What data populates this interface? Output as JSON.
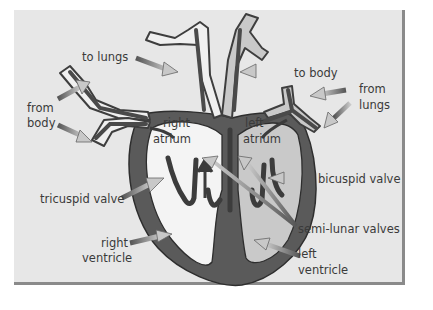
{
  "diagram": {
    "colors": {
      "background": "#e7e7e7",
      "panel_border": "#8a8a8a",
      "heart_wall": "#5a5a5a",
      "outline": "#2e2e2e",
      "right_side_chamber": "#f4f4f4",
      "left_side_chamber": "#c9c9c9",
      "label_arrow_dark": "#5c5c5c",
      "label_arrow_light": "#bdbdbd",
      "text": "#3a3a3a"
    },
    "labels": {
      "to_lungs": "to lungs",
      "from_body_1": "from",
      "from_body_2": "body",
      "right_atrium_1": "right",
      "right_atrium_2": "atrium",
      "to_body": "to body",
      "from_lungs_1": "from",
      "from_lungs_2": "lungs",
      "left_atrium_1": "left",
      "left_atrium_2": "atrium",
      "tricuspid_valve": "tricuspid valve",
      "bicuspid_valve": "bicuspid valve",
      "semi_lunar_valves": "semi-lunar valves",
      "right_ventricle_1": "right",
      "right_ventricle_2": "ventricle",
      "left_ventricle_1": "left",
      "left_ventricle_2": "ventricle"
    }
  }
}
